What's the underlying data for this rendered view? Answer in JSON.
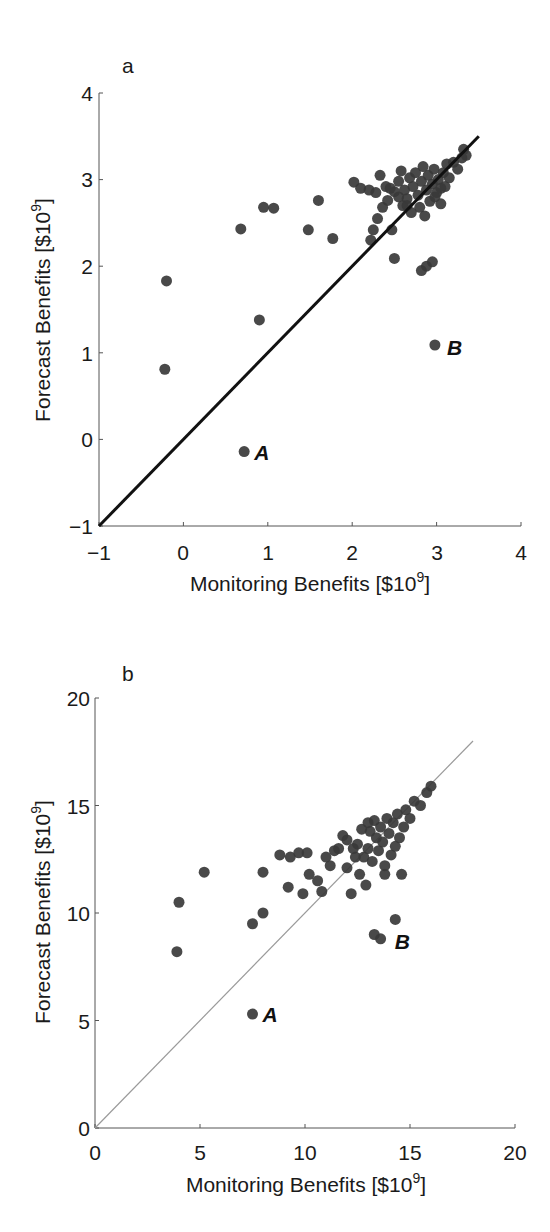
{
  "chart_data": [
    {
      "type": "scatter",
      "panel_label": "a",
      "title": "",
      "xlabel": "Monitoring Benefits [$10^9]",
      "ylabel": "Forecast Benefits [$10^9]",
      "xlim": [
        -1,
        4
      ],
      "ylim": [
        -1,
        4
      ],
      "xticks": [
        -1,
        0,
        1,
        2,
        3,
        4
      ],
      "yticks": [
        -1,
        0,
        1,
        2,
        3,
        4
      ],
      "grid": false,
      "reference_line": {
        "type": "1:1",
        "from": [
          -1,
          -1
        ],
        "to": [
          3.5,
          3.5
        ],
        "style": "thick black"
      },
      "annotations": [
        {
          "text": "A",
          "x": 0.72,
          "y": -0.14
        },
        {
          "text": "B",
          "x": 2.98,
          "y": 1.09
        }
      ],
      "points": [
        [
          -0.22,
          0.81
        ],
        [
          -0.2,
          1.83
        ],
        [
          0.68,
          2.43
        ],
        [
          0.9,
          1.38
        ],
        [
          0.95,
          2.68
        ],
        [
          1.07,
          2.67
        ],
        [
          1.48,
          2.42
        ],
        [
          1.6,
          2.76
        ],
        [
          1.77,
          2.32
        ],
        [
          0.72,
          -0.14
        ],
        [
          2.98,
          1.09
        ],
        [
          2.02,
          2.97
        ],
        [
          2.1,
          2.9
        ],
        [
          2.2,
          2.88
        ],
        [
          2.28,
          2.85
        ],
        [
          2.33,
          3.05
        ],
        [
          2.4,
          2.92
        ],
        [
          2.22,
          2.3
        ],
        [
          2.25,
          2.42
        ],
        [
          2.3,
          2.55
        ],
        [
          2.36,
          2.68
        ],
        [
          2.42,
          2.76
        ],
        [
          2.47,
          2.42
        ],
        [
          2.5,
          2.09
        ],
        [
          2.5,
          2.86
        ],
        [
          2.55,
          2.98
        ],
        [
          2.58,
          3.1
        ],
        [
          2.6,
          2.7
        ],
        [
          2.62,
          2.88
        ],
        [
          2.65,
          2.78
        ],
        [
          2.68,
          3.02
        ],
        [
          2.7,
          2.62
        ],
        [
          2.72,
          2.92
        ],
        [
          2.75,
          3.08
        ],
        [
          2.78,
          2.82
        ],
        [
          2.8,
          2.68
        ],
        [
          2.82,
          2.98
        ],
        [
          2.84,
          3.15
        ],
        [
          2.86,
          2.58
        ],
        [
          2.88,
          2.88
        ],
        [
          2.9,
          3.05
        ],
        [
          2.92,
          2.75
        ],
        [
          2.95,
          2.95
        ],
        [
          2.97,
          3.12
        ],
        [
          3.0,
          2.85
        ],
        [
          3.02,
          3.0
        ],
        [
          3.05,
          2.72
        ],
        [
          3.08,
          3.08
        ],
        [
          3.1,
          2.92
        ],
        [
          3.12,
          3.18
        ],
        [
          3.15,
          3.02
        ],
        [
          3.2,
          3.2
        ],
        [
          3.25,
          3.12
        ],
        [
          3.3,
          3.25
        ],
        [
          3.32,
          3.35
        ],
        [
          3.35,
          3.28
        ],
        [
          2.82,
          1.95
        ],
        [
          2.88,
          2.0
        ],
        [
          2.95,
          2.05
        ],
        [
          2.65,
          2.7
        ],
        [
          2.55,
          2.8
        ],
        [
          2.45,
          2.9
        ],
        [
          2.98,
          2.8
        ],
        [
          3.05,
          2.9
        ]
      ]
    },
    {
      "type": "scatter",
      "panel_label": "b",
      "title": "",
      "xlabel": "Monitoring Benefits [$10^9]",
      "ylabel": "Forecast Benefits [$10^9]",
      "xlim": [
        0,
        20
      ],
      "ylim": [
        0,
        20
      ],
      "xticks": [
        0,
        5,
        10,
        15,
        20
      ],
      "yticks": [
        0,
        5,
        10,
        15,
        20
      ],
      "grid": false,
      "reference_line": {
        "type": "1:1",
        "from": [
          0,
          0
        ],
        "to": [
          18,
          18
        ],
        "style": "thin gray"
      },
      "annotations": [
        {
          "text": "A",
          "x": 7.5,
          "y": 5.3
        },
        {
          "text": "B",
          "x": 13.7,
          "y": 8.8
        }
      ],
      "points": [
        [
          3.9,
          8.2
        ],
        [
          4.0,
          10.5
        ],
        [
          5.2,
          11.9
        ],
        [
          7.5,
          9.5
        ],
        [
          8.0,
          10.0
        ],
        [
          7.5,
          5.3
        ],
        [
          8.0,
          11.9
        ],
        [
          8.8,
          12.7
        ],
        [
          9.3,
          12.6
        ],
        [
          9.7,
          12.8
        ],
        [
          10.1,
          12.8
        ],
        [
          9.2,
          11.2
        ],
        [
          9.9,
          10.9
        ],
        [
          10.2,
          11.8
        ],
        [
          10.6,
          11.5
        ],
        [
          10.8,
          11.0
        ],
        [
          11.2,
          12.2
        ],
        [
          11.4,
          12.9
        ],
        [
          11.6,
          13.0
        ],
        [
          11.8,
          13.6
        ],
        [
          12.0,
          12.1
        ],
        [
          12.2,
          10.9
        ],
        [
          12.4,
          12.6
        ],
        [
          12.5,
          13.2
        ],
        [
          12.6,
          11.8
        ],
        [
          12.8,
          12.6
        ],
        [
          12.9,
          11.3
        ],
        [
          13.0,
          13.0
        ],
        [
          13.1,
          13.8
        ],
        [
          13.2,
          12.4
        ],
        [
          13.3,
          14.3
        ],
        [
          13.4,
          13.5
        ],
        [
          13.5,
          12.9
        ],
        [
          13.6,
          14.0
        ],
        [
          13.7,
          13.3
        ],
        [
          13.8,
          11.8
        ],
        [
          13.9,
          14.4
        ],
        [
          14.0,
          13.7
        ],
        [
          14.1,
          12.7
        ],
        [
          14.2,
          14.2
        ],
        [
          14.3,
          13.1
        ],
        [
          14.4,
          14.6
        ],
        [
          14.5,
          13.5
        ],
        [
          14.6,
          11.8
        ],
        [
          14.7,
          14.0
        ],
        [
          14.8,
          14.8
        ],
        [
          15.0,
          14.4
        ],
        [
          15.2,
          15.2
        ],
        [
          15.5,
          15.0
        ],
        [
          15.8,
          15.6
        ],
        [
          16.0,
          15.9
        ],
        [
          14.3,
          9.7
        ],
        [
          13.3,
          9.0
        ],
        [
          13.6,
          8.8
        ],
        [
          12.0,
          13.4
        ],
        [
          12.7,
          13.9
        ],
        [
          13.0,
          14.2
        ],
        [
          12.3,
          13.0
        ],
        [
          11.0,
          12.6
        ],
        [
          13.8,
          12.2
        ]
      ]
    }
  ],
  "panels": {
    "a": {
      "label": "a",
      "xlabel_main": "Monitoring Benefits [$10",
      "xlabel_exp": "9",
      "xlabel_close": "]",
      "ylabel_main": "Forecast Benefits [$10",
      "ylabel_exp": "9",
      "ylabel_close": "]",
      "xtick_labels": [
        "−1",
        "0",
        "1",
        "2",
        "3",
        "4"
      ],
      "ytick_labels": [
        "−1",
        "0",
        "1",
        "2",
        "3",
        "4"
      ],
      "annotation_a": "A",
      "annotation_b": "B"
    },
    "b": {
      "label": "b",
      "xlabel_main": "Monitoring Benefits [$10",
      "xlabel_exp": "9",
      "xlabel_close": "]",
      "ylabel_main": "Forecast Benefits [$10",
      "ylabel_exp": "9",
      "ylabel_close": "]",
      "xtick_labels": [
        "0",
        "5",
        "10",
        "15",
        "20"
      ],
      "ytick_labels": [
        "0",
        "5",
        "10",
        "15",
        "20"
      ],
      "annotation_a": "A",
      "annotation_b": "B"
    }
  },
  "colors": {
    "marker": "#3a3a3a",
    "axis": "#555555",
    "line_a": "#111111",
    "line_b": "#9a9a9a"
  }
}
